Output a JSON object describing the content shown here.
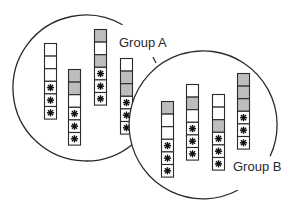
{
  "diagram": {
    "colors": {
      "stroke": "#2a2a2a",
      "gray_cell": "#bdbdbd",
      "white_cell": "#ffffff",
      "background": "#ffffff"
    },
    "cell_legend": {
      "W": "white",
      "G": "gray",
      "S": "star"
    },
    "groups": [
      {
        "id": "A",
        "label": "Group A",
        "circle": {
          "cx": 86,
          "cy": 88,
          "r": 73
        },
        "label_pos": {
          "x": 119,
          "y": 36
        },
        "columns": [
          {
            "x": 44,
            "y": 43,
            "cells": [
              "W",
              "W",
              "W",
              "S",
              "S",
              "S"
            ]
          },
          {
            "x": 68,
            "y": 69,
            "cells": [
              "G",
              "G",
              "W",
              "S",
              "S",
              "S"
            ]
          },
          {
            "x": 94,
            "y": 29,
            "cells": [
              "G",
              "W",
              "G",
              "S",
              "S",
              "S"
            ]
          },
          {
            "x": 120,
            "y": 58,
            "cells": [
              "W",
              "G",
              "G",
              "S",
              "S",
              "S"
            ]
          }
        ]
      },
      {
        "id": "B",
        "label": "Group B",
        "circle": {
          "cx": 203,
          "cy": 125,
          "r": 74
        },
        "label_pos": {
          "x": 233,
          "y": 160
        },
        "columns": [
          {
            "x": 161,
            "y": 101,
            "cells": [
              "G",
              "W",
              "W",
              "S",
              "S",
              "S"
            ]
          },
          {
            "x": 186,
            "y": 84,
            "cells": [
              "W",
              "G",
              "W",
              "S",
              "S",
              "S"
            ]
          },
          {
            "x": 212,
            "y": 94,
            "cells": [
              "W",
              "W",
              "G",
              "S",
              "S",
              "S"
            ]
          },
          {
            "x": 237,
            "y": 73,
            "cells": [
              "G",
              "G",
              "G",
              "S",
              "S",
              "S"
            ]
          }
        ]
      }
    ],
    "cell_size": {
      "w": 12,
      "h": 12.6
    }
  }
}
